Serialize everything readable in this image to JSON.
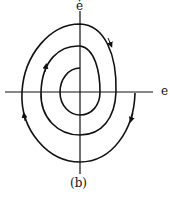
{
  "diagram": {
    "y_axis_label": "ė",
    "x_axis_label": "e",
    "caption": "(b)",
    "stroke_color": "#111111"
  }
}
